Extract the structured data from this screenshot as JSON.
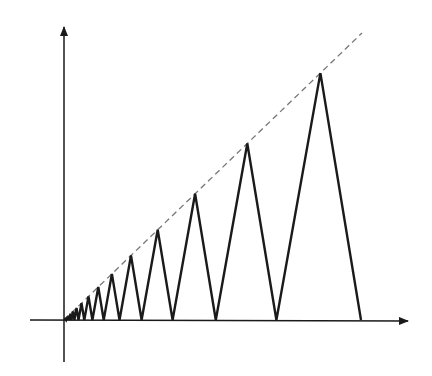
{
  "diagram": {
    "origin": [
      64,
      320
    ],
    "axes": {
      "x_axis": {
        "from": [
          30,
          320
        ],
        "to": [
          408,
          321
        ]
      },
      "y_axis": {
        "from": [
          64,
          362
        ],
        "to": [
          64,
          27
        ]
      }
    },
    "dashed_line": {
      "from": [
        64,
        320
      ],
      "to": [
        362,
        33
      ]
    },
    "zigzag": {
      "ratio": 0.715,
      "largest_base_right_x": 361,
      "count": 16,
      "stroke_color": "#1a1a1a"
    },
    "colors": {
      "axis": "#1a1a1a",
      "zigzag": "#1a1a1a",
      "dashed": "#777777",
      "background": "#ffffff"
    }
  }
}
